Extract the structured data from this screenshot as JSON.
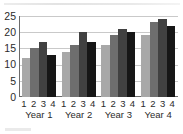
{
  "chart_data": {
    "type": "bar",
    "title": "",
    "subtitle": "",
    "xlabel": "",
    "ylabel": "",
    "ylim": [
      0,
      25
    ],
    "ytick_labels": [
      "25",
      "20",
      "15",
      "10",
      "5",
      "0"
    ],
    "ytick_values": [
      25,
      20,
      15,
      10,
      5,
      0
    ],
    "grid": true,
    "grid_axis": "y",
    "legend": false,
    "legend_position": "none",
    "categories": [
      "Year 1",
      "Year 2",
      "Year 3",
      "Year 4"
    ],
    "tick_labels_within_group": [
      "1",
      "2",
      "3",
      "4"
    ],
    "series": [
      {
        "name": "1",
        "values": [
          12,
          14,
          16,
          19
        ],
        "color": "#a8a8a8"
      },
      {
        "name": "2",
        "values": [
          15,
          16,
          19,
          23
        ],
        "color": "#6e6e6e"
      },
      {
        "name": "3",
        "values": [
          17,
          20,
          21,
          24
        ],
        "color": "#414141"
      },
      {
        "name": "4",
        "values": [
          13,
          17,
          20,
          22
        ],
        "color": "#161616"
      }
    ]
  },
  "axis": {
    "line_color": "#6b6b6b",
    "grid_color": "#c9c9c9",
    "text_color": "#2b2b2b"
  }
}
